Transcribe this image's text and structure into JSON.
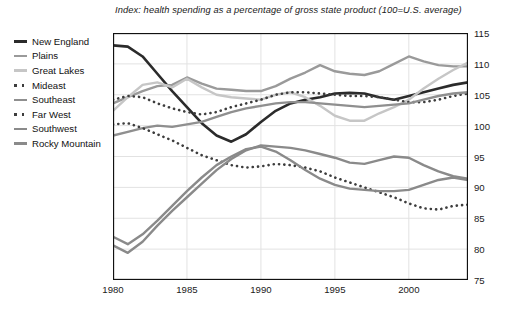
{
  "chart_data": {
    "type": "line",
    "title": "Index: health spending as a percentage of gross state product (100=U.S. average)",
    "xlabel": "",
    "ylabel": "",
    "xlim": [
      1980,
      2004
    ],
    "ylim": [
      75,
      115
    ],
    "yticks": [
      75,
      80,
      85,
      90,
      95,
      100,
      105,
      110,
      115
    ],
    "xticks": [
      1980,
      1985,
      1990,
      1995,
      2000
    ],
    "grid": "both",
    "y_axis_position": "right",
    "legend_position": "left-outside",
    "x": [
      1980,
      1981,
      1982,
      1983,
      1984,
      1985,
      1986,
      1987,
      1988,
      1989,
      1990,
      1991,
      1992,
      1993,
      1994,
      1995,
      1996,
      1997,
      1998,
      1999,
      2000,
      2001,
      2002,
      2003,
      2004
    ],
    "series": [
      {
        "name": "New England",
        "color": "#2b2b2b",
        "style": "solid",
        "width": 2.6,
        "values": [
          113.0,
          112.8,
          111.2,
          108.4,
          105.6,
          103.0,
          100.4,
          98.4,
          97.4,
          98.6,
          100.6,
          102.4,
          103.6,
          104.2,
          104.6,
          105.2,
          105.3,
          105.2,
          104.6,
          104.2,
          104.8,
          105.4,
          106.0,
          106.6,
          107.0
        ]
      },
      {
        "name": "Plains",
        "color": "#9a9a9a",
        "style": "solid",
        "width": 2.4,
        "values": [
          103.6,
          104.6,
          105.6,
          106.4,
          106.6,
          107.8,
          106.8,
          106.0,
          105.8,
          105.6,
          105.6,
          106.4,
          107.6,
          108.6,
          109.8,
          108.8,
          108.4,
          108.2,
          108.8,
          110.0,
          111.2,
          110.4,
          109.8,
          109.6,
          109.6
        ]
      },
      {
        "name": "Great Lakes",
        "color": "#c6c6c6",
        "style": "solid",
        "width": 2.4,
        "values": [
          102.4,
          104.6,
          106.6,
          107.0,
          106.2,
          107.6,
          106.2,
          105.0,
          104.6,
          104.4,
          104.2,
          105.0,
          105.4,
          104.6,
          103.2,
          101.6,
          100.8,
          100.8,
          102.0,
          103.0,
          104.2,
          106.0,
          107.6,
          109.0,
          110.2
        ]
      },
      {
        "name": "Mideast",
        "color": "#3d3d3d",
        "style": "dotted",
        "width": 2.6,
        "values": [
          104.2,
          104.8,
          104.6,
          103.6,
          102.8,
          102.2,
          101.8,
          102.2,
          103.0,
          103.6,
          104.2,
          105.0,
          105.4,
          105.4,
          105.2,
          105.0,
          104.8,
          104.8,
          104.6,
          104.2,
          103.8,
          103.8,
          104.2,
          104.8,
          105.2
        ]
      },
      {
        "name": "Southeast",
        "color": "#8f8f8f",
        "style": "solid",
        "width": 2.4,
        "values": [
          98.4,
          99.0,
          99.6,
          100.0,
          99.8,
          100.2,
          100.6,
          101.4,
          102.2,
          102.8,
          103.2,
          103.6,
          103.8,
          103.8,
          103.6,
          103.4,
          103.2,
          103.0,
          103.2,
          103.4,
          103.6,
          104.2,
          104.8,
          105.2,
          105.4
        ]
      },
      {
        "name": "Far West",
        "color": "#3d3d3d",
        "style": "dotted",
        "width": 2.6,
        "values": [
          100.2,
          100.4,
          99.6,
          98.6,
          97.6,
          96.4,
          95.2,
          94.4,
          93.6,
          93.2,
          93.4,
          93.8,
          93.6,
          93.2,
          92.6,
          91.6,
          90.8,
          90.0,
          89.2,
          88.4,
          87.4,
          86.6,
          86.4,
          87.0,
          87.2
        ]
      },
      {
        "name": "Southwest",
        "color": "#8a8a8a",
        "style": "solid",
        "width": 2.4,
        "values": [
          80.6,
          79.4,
          81.2,
          83.8,
          86.2,
          88.4,
          90.6,
          92.8,
          94.6,
          96.0,
          96.8,
          96.6,
          96.4,
          96.0,
          95.4,
          94.8,
          94.0,
          93.8,
          94.4,
          95.0,
          94.8,
          93.6,
          92.6,
          91.8,
          91.4
        ]
      },
      {
        "name": "Rocky Mountain",
        "color": "#8a8a8a",
        "style": "solid",
        "width": 2.4,
        "values": [
          82.0,
          80.8,
          82.4,
          84.6,
          87.0,
          89.4,
          91.6,
          93.6,
          95.0,
          96.2,
          96.6,
          95.8,
          94.4,
          92.8,
          91.4,
          90.4,
          89.8,
          89.6,
          89.4,
          89.4,
          89.6,
          90.4,
          91.2,
          91.6,
          91.2
        ]
      }
    ]
  },
  "legend": {
    "items": [
      {
        "label": "New England"
      },
      {
        "label": "Plains"
      },
      {
        "label": "Great Lakes"
      },
      {
        "label": "Mideast"
      },
      {
        "label": "Southeast"
      },
      {
        "label": "Far West"
      },
      {
        "label": "Southwest"
      },
      {
        "label": "Rocky Mountain"
      }
    ]
  },
  "axis": {
    "frame_color": "#111111",
    "grid_color": "#e2e2e2"
  }
}
